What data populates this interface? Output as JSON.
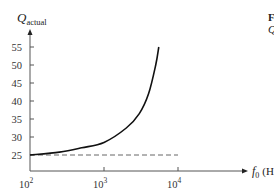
{
  "chart_data": {
    "type": "line",
    "title": "",
    "xlabel": "f_0 (Hz)",
    "ylabel": "Q_actual",
    "xscale": "log",
    "xlim": [
      100,
      10000
    ],
    "ylim": [
      20,
      58
    ],
    "x_ticks": [
      100,
      1000,
      10000
    ],
    "x_tick_labels": [
      "10",
      "10",
      "10"
    ],
    "x_tick_exponents": [
      "2",
      "3",
      "4"
    ],
    "y_ticks": [
      25,
      30,
      35,
      40,
      45,
      50,
      55
    ],
    "y_tick_labels": [
      "25",
      "30",
      "35",
      "40",
      "45",
      "50",
      "55"
    ],
    "grid": false,
    "legend": null,
    "series": [
      {
        "name": "Q_actual",
        "style": "solid",
        "x": [
          100,
          250,
          500,
          1000,
          2000,
          3000,
          4000,
          5000,
          5500
        ],
        "y": [
          25,
          25.8,
          27,
          28.5,
          32.5,
          36.5,
          42,
          50,
          55
        ]
      },
      {
        "name": "Q (design, 25)",
        "style": "dashed",
        "x": [
          100,
          10000
        ],
        "y": [
          25,
          25
        ]
      }
    ]
  },
  "labels": {
    "y_axis_main": "Q",
    "y_axis_sub": "actual",
    "x_axis_main": "f",
    "x_axis_sub": "0",
    "x_axis_unit": "(Hz)",
    "side_line1": "F",
    "side_line2": "Q"
  }
}
